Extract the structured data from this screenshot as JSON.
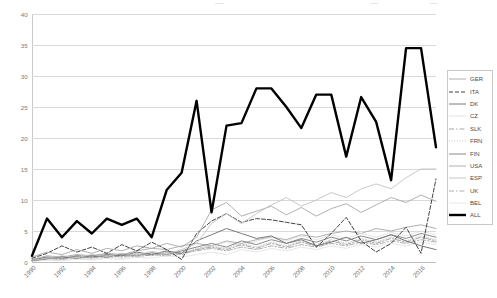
{
  "chart_data": {
    "type": "line",
    "title": "",
    "xlabel": "",
    "ylabel": "",
    "ylim": [
      0,
      40
    ],
    "ytick_values": [
      0,
      5,
      10,
      15,
      20,
      25,
      30,
      35,
      40
    ],
    "grid": true,
    "legend_position": "right",
    "x": [
      1990,
      1991,
      1992,
      1993,
      1994,
      1995,
      1996,
      1997,
      1998,
      1999,
      2000,
      2001,
      2002,
      2003,
      2004,
      2005,
      2006,
      2007,
      2008,
      2009,
      2010,
      2011,
      2012,
      2013,
      2014,
      2015,
      2016,
      2017
    ],
    "xtick_labels": [
      "1990",
      "1992",
      "1994",
      "1996",
      "1998",
      "2000",
      "2002",
      "2004",
      "2006",
      "2008",
      "2010",
      "2012",
      "2014",
      "2016"
    ],
    "series": [
      {
        "name": "GER",
        "style": "solid",
        "color": "#9a9a9a",
        "width": 0.8,
        "values": [
          0.4,
          1.0,
          0.8,
          1.2,
          1.0,
          1.4,
          1.2,
          1.8,
          2.2,
          2.0,
          2.6,
          3.0,
          2.6,
          3.4,
          3.0,
          3.6,
          4.0,
          3.6,
          4.4,
          4.0,
          4.6,
          5.0,
          4.6,
          5.4,
          5.0,
          5.6,
          6.0,
          5.4
        ]
      },
      {
        "name": "ITA",
        "style": "dashed",
        "color": "#2e2e2e",
        "width": 0.9,
        "values": [
          0.6,
          1.4,
          2.6,
          1.6,
          2.4,
          1.4,
          2.8,
          1.8,
          3.2,
          2.0,
          0.4,
          4.6,
          6.6,
          7.8,
          6.4,
          7.0,
          6.8,
          6.4,
          6.0,
          2.4,
          4.6,
          7.2,
          3.4,
          1.6,
          3.0,
          5.6,
          1.4,
          13.4
        ]
      },
      {
        "name": "DK",
        "style": "solid",
        "color": "#6b6b6b",
        "width": 0.9,
        "values": [
          0.3,
          0.8,
          0.6,
          1.0,
          0.8,
          1.2,
          1.0,
          1.6,
          1.2,
          1.8,
          1.4,
          3.4,
          4.4,
          5.4,
          4.6,
          3.8,
          4.2,
          3.0,
          3.6,
          2.6,
          3.2,
          4.0,
          3.0,
          3.6,
          4.4,
          3.4,
          2.6,
          2.0
        ]
      },
      {
        "name": "CZ",
        "style": "solid",
        "color": "#dcdcdc",
        "width": 0.8,
        "values": [
          0.2,
          0.4,
          0.3,
          0.6,
          0.4,
          0.8,
          0.6,
          1.0,
          1.4,
          1.0,
          1.6,
          2.0,
          2.6,
          3.2,
          2.6,
          3.4,
          4.0,
          3.4,
          4.2,
          3.6,
          4.4,
          3.8,
          4.6,
          4.0,
          4.8,
          4.2,
          5.0,
          4.4
        ]
      },
      {
        "name": "SLK",
        "style": "dashdot",
        "color": "#8f8f8f",
        "width": 0.8,
        "values": [
          0.2,
          0.6,
          0.4,
          0.9,
          0.6,
          1.1,
          0.8,
          1.3,
          1.0,
          1.6,
          1.2,
          2.0,
          2.4,
          2.0,
          2.8,
          2.2,
          3.0,
          2.4,
          3.2,
          2.6,
          3.4,
          2.8,
          3.6,
          3.0,
          3.8,
          3.2,
          4.0,
          3.4
        ]
      },
      {
        "name": "FRN",
        "style": "dotted",
        "color": "#bcbcbc",
        "width": 0.8,
        "values": [
          0.3,
          0.7,
          0.5,
          1.0,
          0.7,
          1.2,
          0.9,
          1.4,
          1.1,
          1.7,
          1.3,
          2.2,
          2.6,
          2.2,
          3.0,
          2.4,
          3.2,
          2.6,
          3.4,
          2.8,
          3.6,
          3.0,
          3.8,
          3.2,
          4.0,
          3.4,
          4.2,
          3.6
        ]
      },
      {
        "name": "FIN",
        "style": "solid",
        "color": "#7d7d7d",
        "width": 0.9,
        "values": [
          0.2,
          0.5,
          0.9,
          0.6,
          1.1,
          0.8,
          1.3,
          1.0,
          1.5,
          1.2,
          1.8,
          2.4,
          3.0,
          2.4,
          3.4,
          2.8,
          3.6,
          3.0,
          3.8,
          3.2,
          4.0,
          3.4,
          4.2,
          3.6,
          4.4,
          3.8,
          4.6,
          4.0
        ]
      },
      {
        "name": "USA",
        "style": "solid",
        "color": "#a8a8a8",
        "width": 0.9,
        "values": [
          0.8,
          1.6,
          1.2,
          2.0,
          1.4,
          2.2,
          1.8,
          2.6,
          2.2,
          3.0,
          2.4,
          4.0,
          8.4,
          9.6,
          7.4,
          8.2,
          9.0,
          7.6,
          8.8,
          7.4,
          8.6,
          9.4,
          8.0,
          9.2,
          10.4,
          9.6,
          10.8,
          9.8
        ]
      },
      {
        "name": "ESP",
        "style": "solid",
        "color": "#c2c2c2",
        "width": 0.9,
        "values": [
          0.3,
          0.6,
          1.0,
          0.7,
          1.2,
          0.9,
          1.4,
          1.1,
          1.7,
          1.3,
          2.0,
          3.0,
          6.2,
          7.8,
          6.2,
          7.8,
          9.2,
          10.4,
          9.0,
          10.0,
          11.2,
          10.4,
          11.8,
          12.6,
          11.8,
          13.6,
          15.0,
          15.0
        ]
      },
      {
        "name": "UK",
        "style": "dashdot",
        "color": "#999999",
        "width": 0.8,
        "values": [
          0.2,
          0.5,
          0.8,
          0.5,
          0.9,
          0.7,
          1.1,
          0.8,
          1.2,
          1.0,
          1.4,
          1.8,
          2.2,
          1.8,
          2.4,
          2.0,
          2.6,
          2.2,
          2.8,
          2.4,
          3.0,
          2.6,
          3.2,
          2.8,
          3.4,
          3.0,
          3.6,
          3.2
        ]
      },
      {
        "name": "BEL",
        "style": "solid",
        "color": "#e0e0e0",
        "width": 0.8,
        "values": [
          0.1,
          0.3,
          0.2,
          0.5,
          0.3,
          0.6,
          0.4,
          0.8,
          0.6,
          1.0,
          0.8,
          1.2,
          1.6,
          1.2,
          2.0,
          1.6,
          2.2,
          1.8,
          2.4,
          2.0,
          2.6,
          2.2,
          2.8,
          2.4,
          3.0,
          2.6,
          3.2,
          2.8
        ]
      },
      {
        "name": "ALL",
        "style": "solid",
        "color": "#000000",
        "width": 2.4,
        "values": [
          1.0,
          7.0,
          4.0,
          6.6,
          4.6,
          7.0,
          6.0,
          7.0,
          4.0,
          11.6,
          14.4,
          26.0,
          8.0,
          22.0,
          22.4,
          28.0,
          28.0,
          25.0,
          21.6,
          27.0,
          27.0,
          17.0,
          26.6,
          22.6,
          13.2,
          34.5,
          34.5,
          18.5
        ]
      }
    ]
  },
  "legend": {
    "items": [
      {
        "label": "GER"
      },
      {
        "label": "ITA"
      },
      {
        "label": "DK"
      },
      {
        "label": "CZ"
      },
      {
        "label": "SLK"
      },
      {
        "label": "FRN"
      },
      {
        "label": "FIN"
      },
      {
        "label": "USA"
      },
      {
        "label": "ESP"
      },
      {
        "label": "UK"
      },
      {
        "label": "BEL"
      },
      {
        "label": "ALL"
      }
    ]
  }
}
